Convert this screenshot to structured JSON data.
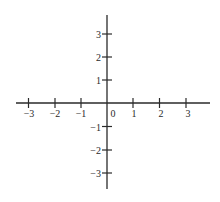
{
  "diagram": {
    "type": "coordinate-plane",
    "title": "",
    "colors": {
      "axis": "#2a2a2a",
      "background": "#ffffff",
      "label": "#2a2a2a"
    },
    "origin_label": "0",
    "x_axis": {
      "range": [
        -3,
        3
      ],
      "ticks": [
        {
          "value": -3,
          "label": "−3"
        },
        {
          "value": -2,
          "label": "−2"
        },
        {
          "value": -1,
          "label": "−1"
        },
        {
          "value": 1,
          "label": "1"
        },
        {
          "value": 2,
          "label": "2"
        },
        {
          "value": 3,
          "label": "3"
        }
      ]
    },
    "y_axis": {
      "range": [
        -3,
        3
      ],
      "ticks": [
        {
          "value": 3,
          "label": "3"
        },
        {
          "value": 2,
          "label": "2"
        },
        {
          "value": 1,
          "label": "1"
        },
        {
          "value": -1,
          "label": "−1"
        },
        {
          "value": -2,
          "label": "−2"
        },
        {
          "value": -3,
          "label": "−3"
        }
      ]
    },
    "grid": false,
    "plotted_points": []
  }
}
